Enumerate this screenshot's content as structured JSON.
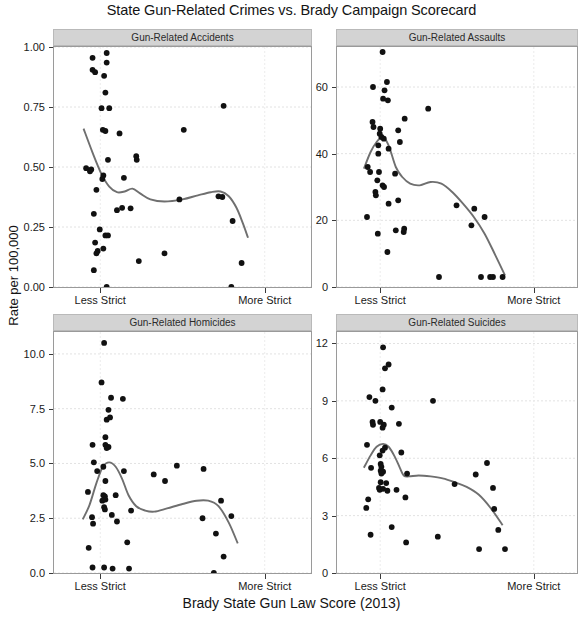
{
  "chart_data": {
    "type": "scatter",
    "title": "State Gun-Related Crimes vs. Brady Campaign Scorecard",
    "xlabel": "Brady State Gun Law Score (2013)",
    "ylabel": "Rate per 100,000",
    "grid": true,
    "legend_position": "none",
    "layout": "2x2 facet grid",
    "point_color": "#111111",
    "line_color": "#6f6f6f",
    "strip_color": "#d3d3d3",
    "x_axis": {
      "tick_labels": [
        "Less Strict",
        "More Strict"
      ],
      "tick_positions": [
        0.18,
        0.82
      ],
      "range": [
        0,
        1
      ],
      "description": "Brady Campaign state gun law score, low (less strict) to high (more strict)"
    },
    "panels": [
      {
        "title": "Gun-Related Accidents",
        "ylim": [
          0.0,
          1.0
        ],
        "yticks": [
          0.0,
          0.25,
          0.5,
          0.75,
          1.0
        ],
        "ytick_labels": [
          "0.00",
          "0.25",
          "0.50",
          "0.75",
          "1.00"
        ],
        "points": [
          [
            0.15,
            0.955
          ],
          [
            0.15,
            0.905
          ],
          [
            0.16,
            0.895
          ],
          [
            0.205,
            0.975
          ],
          [
            0.205,
            0.935
          ],
          [
            0.195,
            0.88
          ],
          [
            0.2,
            0.81
          ],
          [
            0.185,
            0.745
          ],
          [
            0.215,
            0.745
          ],
          [
            0.19,
            0.655
          ],
          [
            0.2,
            0.65
          ],
          [
            0.255,
            0.64
          ],
          [
            0.21,
            0.53
          ],
          [
            0.125,
            0.495
          ],
          [
            0.145,
            0.49
          ],
          [
            0.14,
            0.482
          ],
          [
            0.192,
            0.465
          ],
          [
            0.188,
            0.45
          ],
          [
            0.165,
            0.405
          ],
          [
            0.155,
            0.305
          ],
          [
            0.178,
            0.24
          ],
          [
            0.16,
            0.185
          ],
          [
            0.2,
            0.215
          ],
          [
            0.21,
            0.215
          ],
          [
            0.192,
            0.16
          ],
          [
            0.17,
            0.15
          ],
          [
            0.165,
            0.14
          ],
          [
            0.155,
            0.07
          ],
          [
            0.205,
            0.0
          ],
          [
            0.245,
            0.32
          ],
          [
            0.265,
            0.33
          ],
          [
            0.298,
            0.328
          ],
          [
            0.272,
            0.455
          ],
          [
            0.32,
            0.545
          ],
          [
            0.322,
            0.53
          ],
          [
            0.33,
            0.108
          ],
          [
            0.43,
            0.14
          ],
          [
            0.505,
            0.655
          ],
          [
            0.488,
            0.365
          ],
          [
            0.64,
            0.378
          ],
          [
            0.66,
            0.755
          ],
          [
            0.655,
            0.375
          ],
          [
            0.695,
            0.275
          ],
          [
            0.73,
            0.1
          ],
          [
            0.69,
            0.0
          ]
        ],
        "loess": [
          [
            0.115,
            0.66
          ],
          [
            0.15,
            0.56
          ],
          [
            0.185,
            0.47
          ],
          [
            0.215,
            0.418
          ],
          [
            0.245,
            0.395
          ],
          [
            0.275,
            0.398
          ],
          [
            0.305,
            0.41
          ],
          [
            0.335,
            0.39
          ],
          [
            0.375,
            0.365
          ],
          [
            0.43,
            0.356
          ],
          [
            0.5,
            0.365
          ],
          [
            0.56,
            0.382
          ],
          [
            0.61,
            0.395
          ],
          [
            0.648,
            0.398
          ],
          [
            0.68,
            0.378
          ],
          [
            0.71,
            0.33
          ],
          [
            0.735,
            0.265
          ],
          [
            0.755,
            0.205
          ]
        ]
      },
      {
        "title": "Gun-Related Assaults",
        "ylim": [
          0,
          72
        ],
        "yticks": [
          0,
          20,
          40,
          60
        ],
        "ytick_labels": [
          "0",
          "20",
          "40",
          "60"
        ],
        "points": [
          [
            0.19,
            70.5
          ],
          [
            0.208,
            61.5
          ],
          [
            0.15,
            60.0
          ],
          [
            0.198,
            59.0
          ],
          [
            0.192,
            56.5
          ],
          [
            0.212,
            56.0
          ],
          [
            0.148,
            49.5
          ],
          [
            0.152,
            48.0
          ],
          [
            0.18,
            47.5
          ],
          [
            0.178,
            46.0
          ],
          [
            0.185,
            45.0
          ],
          [
            0.195,
            44.5
          ],
          [
            0.172,
            42.5
          ],
          [
            0.215,
            41.5
          ],
          [
            0.172,
            40.0
          ],
          [
            0.128,
            36.0
          ],
          [
            0.138,
            34.5
          ],
          [
            0.175,
            34.5
          ],
          [
            0.168,
            32.0
          ],
          [
            0.19,
            30.5
          ],
          [
            0.196,
            30.0
          ],
          [
            0.16,
            28.5
          ],
          [
            0.162,
            27.5
          ],
          [
            0.125,
            21.0
          ],
          [
            0.215,
            25.0
          ],
          [
            0.17,
            16.0
          ],
          [
            0.21,
            10.5
          ],
          [
            0.242,
            34.0
          ],
          [
            0.255,
            47.0
          ],
          [
            0.262,
            43.5
          ],
          [
            0.282,
            50.5
          ],
          [
            0.255,
            26.0
          ],
          [
            0.245,
            17.0
          ],
          [
            0.278,
            16.5
          ],
          [
            0.28,
            17.5
          ],
          [
            0.38,
            53.5
          ],
          [
            0.425,
            3.0
          ],
          [
            0.498,
            24.5
          ],
          [
            0.572,
            23.5
          ],
          [
            0.56,
            18.5
          ],
          [
            0.615,
            21.0
          ],
          [
            0.6,
            3.0
          ],
          [
            0.638,
            3.0
          ],
          [
            0.65,
            3.0
          ],
          [
            0.69,
            3.0
          ]
        ],
        "loess": [
          [
            0.112,
            35.5
          ],
          [
            0.14,
            40.5
          ],
          [
            0.165,
            43.5
          ],
          [
            0.19,
            45.0
          ],
          [
            0.215,
            42.5
          ],
          [
            0.245,
            36.0
          ],
          [
            0.272,
            33.0
          ],
          [
            0.305,
            31.0
          ],
          [
            0.345,
            30.5
          ],
          [
            0.39,
            31.5
          ],
          [
            0.435,
            31.0
          ],
          [
            0.48,
            28.5
          ],
          [
            0.525,
            25.0
          ],
          [
            0.57,
            21.0
          ],
          [
            0.615,
            16.0
          ],
          [
            0.66,
            9.5
          ],
          [
            0.7,
            3.5
          ]
        ]
      },
      {
        "title": "Gun-Related Homicides",
        "ylim": [
          0.0,
          11.0
        ],
        "yticks": [
          0.0,
          2.5,
          5.0,
          7.5,
          10.0
        ],
        "ytick_labels": [
          "0.0",
          "2.5",
          "5.0",
          "7.5",
          "10.0"
        ],
        "points": [
          [
            0.195,
            10.5
          ],
          [
            0.185,
            8.7
          ],
          [
            0.222,
            8.0
          ],
          [
            0.268,
            7.95
          ],
          [
            0.212,
            7.45
          ],
          [
            0.205,
            7.0
          ],
          [
            0.218,
            7.1
          ],
          [
            0.2,
            6.2
          ],
          [
            0.2,
            5.85
          ],
          [
            0.212,
            5.75
          ],
          [
            0.205,
            5.7
          ],
          [
            0.15,
            5.85
          ],
          [
            0.155,
            5.05
          ],
          [
            0.168,
            4.65
          ],
          [
            0.192,
            4.85
          ],
          [
            0.2,
            4.2
          ],
          [
            0.272,
            4.65
          ],
          [
            0.132,
            3.7
          ],
          [
            0.192,
            3.55
          ],
          [
            0.198,
            3.5
          ],
          [
            0.2,
            3.35
          ],
          [
            0.188,
            3.3
          ],
          [
            0.24,
            3.55
          ],
          [
            0.195,
            3.0
          ],
          [
            0.198,
            2.9
          ],
          [
            0.148,
            2.55
          ],
          [
            0.152,
            2.25
          ],
          [
            0.225,
            2.65
          ],
          [
            0.245,
            2.35
          ],
          [
            0.135,
            1.15
          ],
          [
            0.15,
            0.25
          ],
          [
            0.195,
            0.25
          ],
          [
            0.228,
            0.2
          ],
          [
            0.285,
            1.4
          ],
          [
            0.292,
            0.2
          ],
          [
            0.3,
            2.85
          ],
          [
            0.388,
            4.5
          ],
          [
            0.432,
            4.2
          ],
          [
            0.478,
            4.9
          ],
          [
            0.582,
            4.75
          ],
          [
            0.578,
            2.5
          ],
          [
            0.63,
            1.8
          ],
          [
            0.65,
            3.3
          ],
          [
            0.66,
            0.75
          ],
          [
            0.69,
            2.6
          ],
          [
            0.622,
            0.0
          ]
        ],
        "loess": [
          [
            0.112,
            2.45
          ],
          [
            0.138,
            3.1
          ],
          [
            0.165,
            4.1
          ],
          [
            0.19,
            4.85
          ],
          [
            0.215,
            5.05
          ],
          [
            0.24,
            4.85
          ],
          [
            0.265,
            4.3
          ],
          [
            0.29,
            3.55
          ],
          [
            0.32,
            3.05
          ],
          [
            0.355,
            2.85
          ],
          [
            0.39,
            2.8
          ],
          [
            0.44,
            2.95
          ],
          [
            0.5,
            3.15
          ],
          [
            0.555,
            3.3
          ],
          [
            0.6,
            3.3
          ],
          [
            0.64,
            3.05
          ],
          [
            0.68,
            2.3
          ],
          [
            0.715,
            1.35
          ]
        ]
      },
      {
        "title": "Gun-Related Suicides",
        "ylim": [
          0,
          12.6
        ],
        "yticks": [
          0,
          3,
          6,
          9,
          12
        ],
        "ytick_labels": [
          "0",
          "3",
          "6",
          "9",
          "12"
        ],
        "points": [
          [
            0.192,
            11.8
          ],
          [
            0.215,
            10.9
          ],
          [
            0.2,
            10.7
          ],
          [
            0.19,
            9.6
          ],
          [
            0.135,
            9.2
          ],
          [
            0.16,
            9.0
          ],
          [
            0.228,
            8.65
          ],
          [
            0.148,
            7.9
          ],
          [
            0.15,
            7.75
          ],
          [
            0.18,
            7.9
          ],
          [
            0.195,
            7.75
          ],
          [
            0.19,
            7.6
          ],
          [
            0.258,
            7.8
          ],
          [
            0.125,
            6.7
          ],
          [
            0.2,
            6.55
          ],
          [
            0.19,
            6.4
          ],
          [
            0.178,
            6.15
          ],
          [
            0.268,
            6.3
          ],
          [
            0.142,
            5.5
          ],
          [
            0.182,
            5.7
          ],
          [
            0.185,
            5.55
          ],
          [
            0.182,
            5.35
          ],
          [
            0.192,
            5.3
          ],
          [
            0.185,
            5.2
          ],
          [
            0.182,
            4.75
          ],
          [
            0.205,
            4.7
          ],
          [
            0.175,
            4.45
          ],
          [
            0.178,
            4.35
          ],
          [
            0.192,
            4.4
          ],
          [
            0.21,
            4.3
          ],
          [
            0.248,
            4.35
          ],
          [
            0.13,
            3.85
          ],
          [
            0.122,
            3.4
          ],
          [
            0.228,
            2.4
          ],
          [
            0.14,
            2.0
          ],
          [
            0.285,
            3.95
          ],
          [
            0.292,
            5.2
          ],
          [
            0.288,
            1.6
          ],
          [
            0.4,
            9.0
          ],
          [
            0.42,
            1.9
          ],
          [
            0.49,
            4.65
          ],
          [
            0.578,
            5.15
          ],
          [
            0.625,
            5.75
          ],
          [
            0.65,
            4.45
          ],
          [
            0.655,
            3.35
          ],
          [
            0.672,
            2.25
          ],
          [
            0.592,
            1.25
          ],
          [
            0.7,
            1.25
          ]
        ],
        "loess": [
          [
            0.112,
            5.5
          ],
          [
            0.14,
            6.15
          ],
          [
            0.165,
            6.6
          ],
          [
            0.192,
            6.75
          ],
          [
            0.215,
            6.6
          ],
          [
            0.24,
            6.1
          ],
          [
            0.262,
            5.5
          ],
          [
            0.278,
            5.1
          ],
          [
            0.3,
            5.05
          ],
          [
            0.34,
            5.1
          ],
          [
            0.39,
            5.05
          ],
          [
            0.44,
            4.95
          ],
          [
            0.49,
            4.75
          ],
          [
            0.54,
            4.5
          ],
          [
            0.59,
            4.1
          ],
          [
            0.64,
            3.4
          ],
          [
            0.69,
            2.5
          ]
        ]
      }
    ]
  }
}
